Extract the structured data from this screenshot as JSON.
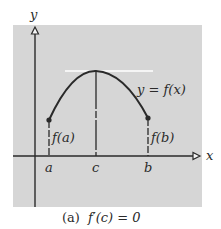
{
  "figure": {
    "caption_label": "(a)",
    "caption_formula": "f′(c) = 0",
    "colors": {
      "panel_bg": "#d6d6d6",
      "ink": "#2a2a2a",
      "tangent": "#ffffff",
      "page_bg": "#ffffff"
    }
  },
  "axes": {
    "x_label": "x",
    "y_label": "y"
  },
  "curve": {
    "label": "y = f(x)"
  },
  "points": {
    "a": {
      "tick_label": "a",
      "value_label": "f(a)"
    },
    "c": {
      "tick_label": "c"
    },
    "b": {
      "tick_label": "b",
      "value_label": "f(b)"
    }
  }
}
